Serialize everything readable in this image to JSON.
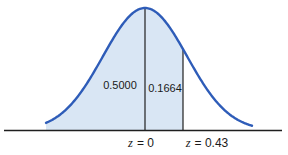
{
  "figure": {
    "background_color": "#ffffff",
    "curve_color": "#2e5cb8",
    "fill_color": "#d9e6f4",
    "line_color": "#1f1f1f",
    "text_color": "#1a1a1a"
  },
  "labels": {
    "left_area": "0.5000",
    "middle_area": "0.1664"
  },
  "axis": {
    "tick_z0": {
      "symbol": "z",
      "rest": "= 0"
    },
    "tick_z043": {
      "symbol": "z",
      "rest": "= 0.43"
    }
  },
  "chart_data": {
    "type": "area",
    "title": "",
    "xlabel": "z",
    "x_ticks": [
      {
        "label": "z = 0",
        "z": 0
      },
      {
        "label": "z = 0.43",
        "z": 0.43
      }
    ],
    "areas": [
      {
        "label": "0.5000",
        "from_z": null,
        "to_z": 0,
        "value": 0.5,
        "shaded": true
      },
      {
        "label": "0.1664",
        "from_z": 0,
        "to_z": 0.43,
        "value": 0.1664,
        "shaded": true
      },
      {
        "label": "",
        "from_z": 0.43,
        "to_z": null,
        "value": null,
        "shaded": false
      }
    ],
    "boundary_lines_z": [
      0,
      0.43
    ],
    "legend": "none",
    "grid": false,
    "geometry": {
      "mu_px": 145,
      "sigma_px": 42,
      "peak_y_px": 8,
      "base_y_px": 130.5,
      "curve_x_start": 46,
      "curve_x_end": 252,
      "z0_x_px": 145,
      "z043_x_px": 183,
      "axis_x_start": 4,
      "axis_x_end": 282
    }
  }
}
